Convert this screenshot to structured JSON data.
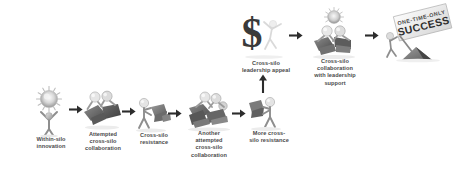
{
  "diagram": {
    "type": "process-flow",
    "background_color": "#ffffff",
    "text_color": "#4a4a4a",
    "art_style": "grayscale 3d stick figures",
    "steps": [
      {
        "id": "within-silo-innovation",
        "label": "Within-silo\ninnovation",
        "icon": "figure-holding-idea-sun-icon",
        "x": 22,
        "y": 86,
        "w": 58,
        "h": 48,
        "caption_x": 18,
        "caption_y": 136,
        "caption_w": 66
      },
      {
        "id": "attempted-cross-silo-collaboration",
        "label": "Attempted\ncross-silo\ncollaboration",
        "icon": "two-figures-collaborating-icon",
        "x": 76,
        "y": 88,
        "w": 52,
        "h": 42,
        "caption_x": 72,
        "caption_y": 131,
        "caption_w": 62
      },
      {
        "id": "cross-silo-resistance",
        "label": "Cross-silo\nresistance",
        "icon": "figure-resisting-icon",
        "x": 131,
        "y": 96,
        "w": 44,
        "h": 38,
        "caption_x": 126,
        "caption_y": 132,
        "caption_w": 56
      },
      {
        "id": "another-attempted-cross-silo-collaboration",
        "label": "Another\nattempted\ncross-silo\ncollaboration",
        "icon": "three-figures-collaborating-icon",
        "x": 179,
        "y": 88,
        "w": 60,
        "h": 44,
        "caption_x": 174,
        "caption_y": 130,
        "caption_w": 70
      },
      {
        "id": "more-cross-silo-resistance",
        "label": "More cross-\nsilo resistance",
        "icon": "figure-resisting-icon",
        "x": 243,
        "y": 92,
        "w": 44,
        "h": 40,
        "caption_x": 234,
        "caption_y": 130,
        "caption_w": 70
      },
      {
        "id": "cross-silo-leadership-appeal",
        "label": "Cross-silo\nleadership appeal",
        "icon": "dollar-sign-with-figure-icon",
        "x": 235,
        "y": 12,
        "w": 58,
        "h": 48,
        "caption_x": 232,
        "caption_y": 60,
        "caption_w": 66
      },
      {
        "id": "cross-silo-collaboration-with-leadership-support",
        "label": "Cross-silo\ncollaboration\nwith leadership\nsupport",
        "icon": "two-figures-with-idea-icon",
        "x": 303,
        "y": 8,
        "w": 62,
        "h": 52,
        "caption_x": 300,
        "caption_y": 58,
        "caption_w": 70
      },
      {
        "id": "one-time-only-success",
        "label": "",
        "icon": "figure-planting-flag-icon",
        "x": 378,
        "y": 8,
        "w": 78,
        "h": 54,
        "caption_x": 0,
        "caption_y": 0,
        "caption_w": 0
      }
    ],
    "banner": {
      "line1": "ONE-TIME-ONLY",
      "line2": "SUCCESS",
      "rotation_deg": -14
    },
    "arrows": [
      {
        "id": "arrow-1",
        "from": "within-silo-innovation",
        "to": "attempted-cross-silo-collaboration",
        "direction": "right",
        "x": 69,
        "y": 108,
        "len": 13
      },
      {
        "id": "arrow-2",
        "from": "attempted-cross-silo-collaboration",
        "to": "cross-silo-resistance",
        "direction": "right",
        "x": 122,
        "y": 110,
        "len": 12
      },
      {
        "id": "arrow-3",
        "from": "cross-silo-resistance",
        "to": "another-attempted-cross-silo-collaboration",
        "direction": "right",
        "x": 168,
        "y": 112,
        "len": 13
      },
      {
        "id": "arrow-4",
        "from": "another-attempted-cross-silo-collaboration",
        "to": "more-cross-silo-resistance",
        "direction": "right",
        "x": 232,
        "y": 112,
        "len": 13
      },
      {
        "id": "arrow-5",
        "from": "more-cross-silo-resistance",
        "to": "cross-silo-leadership-appeal",
        "direction": "up",
        "x": 262,
        "y": 76,
        "len": 18
      },
      {
        "id": "arrow-6",
        "from": "cross-silo-leadership-appeal",
        "to": "cross-silo-collaboration-with-leadership-support",
        "direction": "right",
        "x": 290,
        "y": 34,
        "len": 14
      },
      {
        "id": "arrow-7",
        "from": "cross-silo-collaboration-with-leadership-support",
        "to": "one-time-only-success",
        "direction": "right",
        "x": 366,
        "y": 34,
        "len": 14
      }
    ]
  }
}
